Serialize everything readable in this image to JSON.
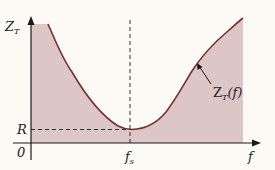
{
  "diagram": {
    "y_axis": {
      "label": "Z",
      "label_sub": "T"
    },
    "x_axis": {
      "label": "f"
    },
    "ticks": {
      "origin": "0",
      "r_label": "R",
      "fs_label": "f",
      "fs_sub": "s"
    },
    "curve": {
      "label": "Z",
      "label_sub": "T",
      "label_suffix": "(f)",
      "description": "Impedance curve with minimum R at resonance frequency fs"
    },
    "colors": {
      "fill": "#dcc6c6",
      "curve": "#7a2d36",
      "axis": "#1a1a1a",
      "background": "#fbfaf4"
    }
  }
}
